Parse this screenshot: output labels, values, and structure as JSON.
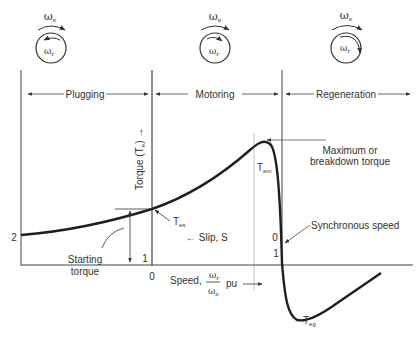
{
  "regions": [
    {
      "label": "Plugging"
    },
    {
      "label": "Motoring"
    },
    {
      "label": "Regeneration"
    }
  ],
  "rotation_diagrams": [
    {
      "stator_label": "ω",
      "stator_sub": "e",
      "rotor_label": "ω",
      "rotor_sub": "r",
      "rotor_direction": "opposite"
    },
    {
      "stator_label": "ω",
      "stator_sub": "e",
      "rotor_label": "ω",
      "rotor_sub": "r",
      "rotor_direction": "same, slower"
    },
    {
      "stator_label": "ω",
      "stator_sub": "e",
      "rotor_label": "ω",
      "rotor_sub": "r",
      "rotor_direction": "same, faster"
    }
  ],
  "axes": {
    "y_label": "Torque (T",
    "y_label_sub": "e",
    "y_label_end": ") →",
    "slip_label": "← Slip, S",
    "speed_label_prefix": "Speed,",
    "speed_num": "ω",
    "speed_num_sub": "r",
    "speed_den": "ω",
    "speed_den_sub": "e",
    "speed_label_suffix": "pu",
    "slip_ticks": {
      "left": "2",
      "mid": "1",
      "right": "0"
    },
    "speed_ticks": {
      "mid": "0",
      "right": "1"
    }
  },
  "annotations": {
    "starting_torque": [
      "Starting",
      "torque"
    ],
    "breakdown": [
      "Maximum or",
      "breakdown torque"
    ],
    "synchronous": "Synchronous speed",
    "tes": {
      "main": "T",
      "sub": "es"
    },
    "tem": {
      "main": "T",
      "sub": "em"
    },
    "teg": {
      "main": "T",
      "sub": "eg"
    }
  },
  "colors": {
    "line": "#2a2a2a",
    "curve": "#1f1f1f",
    "thin": "#555555",
    "guide": "#b5b5b5"
  }
}
